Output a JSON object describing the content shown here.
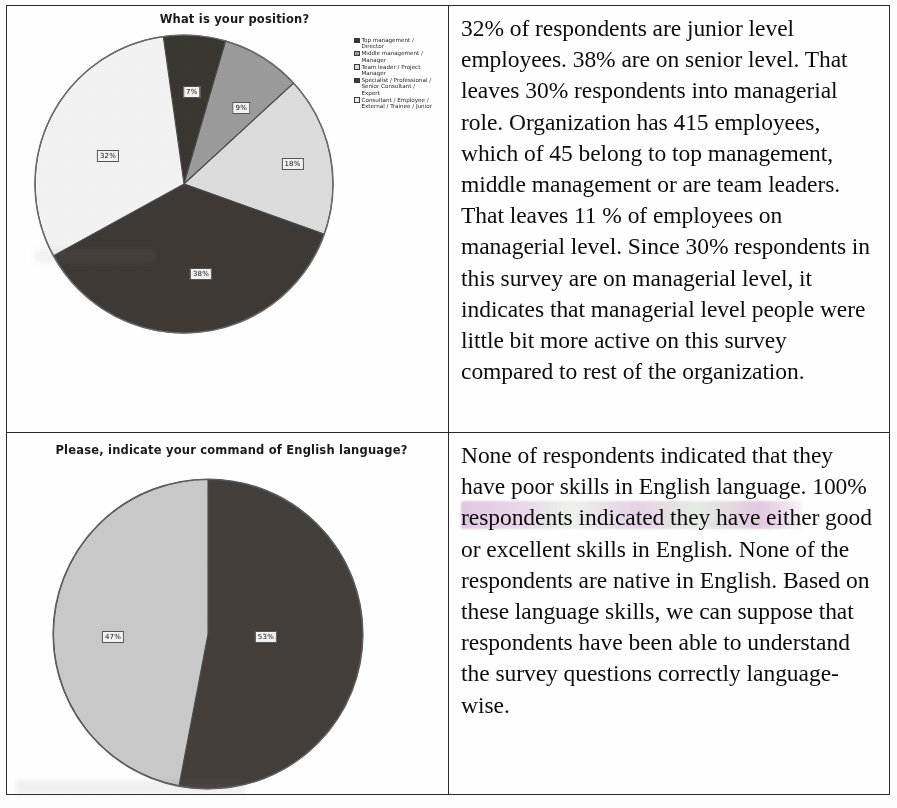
{
  "document": {
    "type": "survey-results-table",
    "columns": [
      "chart",
      "commentary"
    ]
  },
  "row1": {
    "chart_title": "What is your position?",
    "legend": [
      {
        "label": "Top management /\nDirector",
        "color": "#3a3632"
      },
      {
        "label": "Middle management /\nManager",
        "color": "#9b9b9b"
      },
      {
        "label": "Team leader / Project\nManager",
        "color": "#dcdcdc"
      },
      {
        "label": "Specialist / Professional /\nSenior Consultant /\nExpert",
        "color": "#3f3a36"
      },
      {
        "label": "Consultant / Employee /\nExternal / Trainee / Junior",
        "color": "#f2f2f2"
      }
    ],
    "slice_labels": [
      "7%",
      "9%",
      "18%",
      "38%",
      "32%"
    ],
    "commentary": "32% of respondents are junior level employees. 38% are on senior level. That leaves 30% respondents into managerial role. Organization has 415 employees, which of 45 belong to top management, middle management or are team leaders. That leaves 11 % of employees on managerial level. Since 30% respondents in this survey are on managerial level, it indicates that managerial level people were little bit more active on this survey compared to rest of the organization."
  },
  "row2": {
    "chart_title": "Please, indicate your command of English language?",
    "legend": [
      {
        "label": "Good",
        "color": "#443f3b"
      },
      {
        "label": "Excellent",
        "color": "#c9c9c9"
      }
    ],
    "slice_labels": [
      "53%",
      "47%"
    ],
    "commentary": "None of respondents indicated that they have poor skills in English language. 100% respondents indicated they have either good or excellent skills in English. None of the respondents are native in English. Based on these language skills, we can suppose that respondents have been able to understand the survey questions correctly language-wise."
  },
  "chart_data": [
    {
      "type": "pie",
      "title": "What is your position?",
      "categories": [
        "Top management / Director",
        "Middle management / Manager",
        "Team leader / Project Manager",
        "Specialist / Professional / Senior Consultant / Expert",
        "Consultant / Employee / External / Trainee / Junior"
      ],
      "values": [
        7,
        9,
        18,
        38,
        32
      ],
      "value_labels": [
        "7%",
        "9%",
        "18%",
        "38%",
        "32%"
      ],
      "colors": [
        "#3a3632",
        "#9b9b9b",
        "#dcdcdc",
        "#3f3a36",
        "#f2f2f2"
      ],
      "units": "percent",
      "legend_position": "right",
      "start_angle_deg": -8,
      "grid": false
    },
    {
      "type": "pie",
      "title": "Please, indicate your command of English language?",
      "categories": [
        "Good",
        "Excellent"
      ],
      "values": [
        53,
        47
      ],
      "value_labels": [
        "53%",
        "47%"
      ],
      "colors": [
        "#443f3b",
        "#c9c9c9"
      ],
      "units": "percent",
      "legend_position": "right",
      "start_angle_deg": 0,
      "grid": false
    }
  ]
}
